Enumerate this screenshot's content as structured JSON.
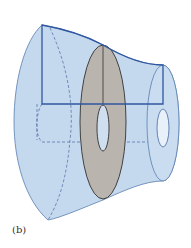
{
  "figure": {
    "label": "(b)",
    "colors": {
      "solid_fill": "#c4d8ee",
      "solid_edge": "#5a7fb0",
      "region_edge": "#2f56a0",
      "washer_fill": "#b9b4ad",
      "washer_edge": "#333333",
      "hole_fill": "#dce8f5",
      "dashed": "#4a6aa0"
    }
  }
}
